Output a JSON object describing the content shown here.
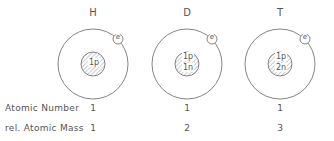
{
  "atoms": [
    {
      "symbol": "H",
      "nucleus": [
        "1p"
      ],
      "electron": "e",
      "atomic_number": "1",
      "rel_atomic_mass": "1"
    },
    {
      "symbol": "D",
      "nucleus": [
        "1p",
        "1n"
      ],
      "electron": "e",
      "atomic_number": "1",
      "rel_atomic_mass": "2"
    },
    {
      "symbol": "T",
      "nucleus": [
        "1p",
        "2n"
      ],
      "electron": "e",
      "atomic_number": "1",
      "rel_atomic_mass": "3"
    }
  ],
  "rows": {
    "atomic_number_label": "Atomic Number",
    "rel_atomic_mass_label": "rel. Atomic Mass"
  },
  "colors": {
    "line": "#666666",
    "text": "#555555"
  }
}
